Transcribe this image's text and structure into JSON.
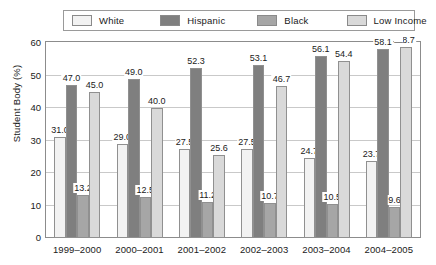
{
  "chart_data": {
    "type": "bar",
    "title": "",
    "xlabel": "",
    "ylabel": "Student Body (%)",
    "ylim": [
      0,
      60
    ],
    "yticks": [
      0,
      10,
      20,
      30,
      40,
      50,
      60
    ],
    "grid": true,
    "legend_position": "top",
    "categories": [
      "1999–2000",
      "2000–2001",
      "2001–2002",
      "2002–2003",
      "2003–2004",
      "2004–2005"
    ],
    "series": [
      {
        "name": "White",
        "color": "#f2f2f2",
        "values": [
          31.0,
          29.0,
          27.5,
          27.5,
          24.7,
          23.7
        ],
        "labels": [
          "31.0",
          "29.0",
          "27.5",
          "27.5",
          "24.7",
          "23.7"
        ]
      },
      {
        "name": "Hispanic",
        "color": "#7f7f7f",
        "values": [
          47.0,
          49.0,
          52.3,
          53.1,
          56.1,
          58.1
        ],
        "labels": [
          "47.0",
          "49.0",
          "52.3",
          "53.1",
          "56.1",
          "58.1"
        ]
      },
      {
        "name": "Black",
        "color": "#a6a6a6",
        "values": [
          13.2,
          12.5,
          11.2,
          10.7,
          10.5,
          9.6
        ],
        "labels": [
          "13.2",
          "12.5",
          "11.2",
          "10.7",
          "10.5",
          "9.6"
        ]
      },
      {
        "name": "Low Income",
        "color": "#d9d9d9",
        "values": [
          45.0,
          40.0,
          25.6,
          46.7,
          54.4,
          58.7
        ],
        "labels": [
          "45.0",
          "40.0",
          "25.6",
          "46.7",
          "54.4",
          "58.7"
        ]
      }
    ],
    "annotations": {
      "label_overlap_dash": "—"
    }
  },
  "legend": {
    "items": [
      {
        "label": "White",
        "color": "#f2f2f2"
      },
      {
        "label": "Hispanic",
        "color": "#7f7f7f"
      },
      {
        "label": "Black",
        "color": "#a6a6a6"
      },
      {
        "label": "Low Income",
        "color": "#d9d9d9"
      }
    ]
  },
  "axes": {
    "y_label": "Student Body (%)",
    "y_ticks": [
      "60",
      "50",
      "40",
      "30",
      "20",
      "10",
      "0"
    ],
    "x_ticks": [
      "1999–2000",
      "2000–2001",
      "2001–2002",
      "2002–2003",
      "2003–2004",
      "2004–2005"
    ]
  }
}
